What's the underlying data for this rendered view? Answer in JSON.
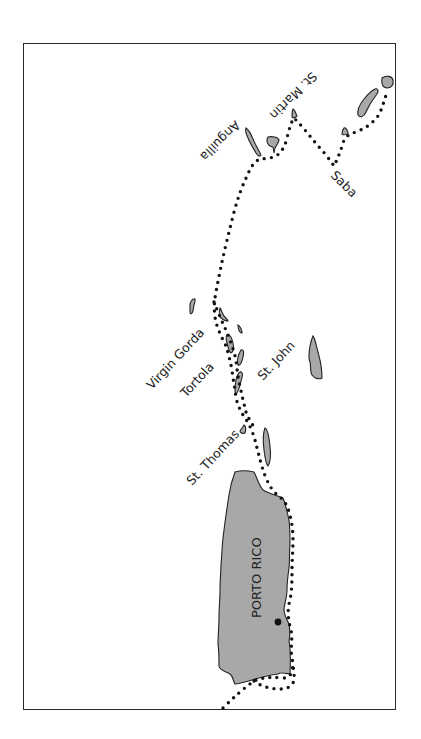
{
  "map": {
    "colors": {
      "land": "#a8a8a8",
      "outline": "#222222",
      "route": "#111111",
      "frame": "#2a2a2a"
    },
    "labels": {
      "anguilla": "Anguilla",
      "st_martin": "St. Martin",
      "saba": "Saba",
      "virgin_gorda": "Virgin Gorda",
      "tortola": "Tortola",
      "st_john": "St. John",
      "st_thomas": "St. Thomas",
      "porto_rico": "PORTO RICO"
    },
    "markers": [
      {
        "name": "town-dot",
        "on": "PORTO RICO"
      }
    ]
  }
}
